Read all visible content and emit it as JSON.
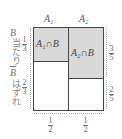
{
  "diagram": {
    "columns": [
      {
        "label": "A₁",
        "width_fraction_label": {
          "num": "1",
          "den": "2"
        }
      },
      {
        "label": "A₂",
        "width_fraction_label": {
          "num": "1",
          "den": "2"
        }
      }
    ],
    "rows_left": [
      {
        "label": "B",
        "sub": "当たり",
        "fraction": {
          "num": "1",
          "den": "3"
        }
      },
      {
        "label": "B̅",
        "sub": "はずれ",
        "fraction": {
          "num": "2",
          "den": "3"
        }
      }
    ],
    "right_fractions": [
      {
        "num": "3",
        "den": "5"
      },
      {
        "num": "2",
        "den": "5"
      }
    ],
    "cells": {
      "a1_b": "A₁∩B",
      "a2_b": "A₂∩B"
    },
    "colors": {
      "shade": "#d9d9d9",
      "border": "#444444"
    }
  }
}
